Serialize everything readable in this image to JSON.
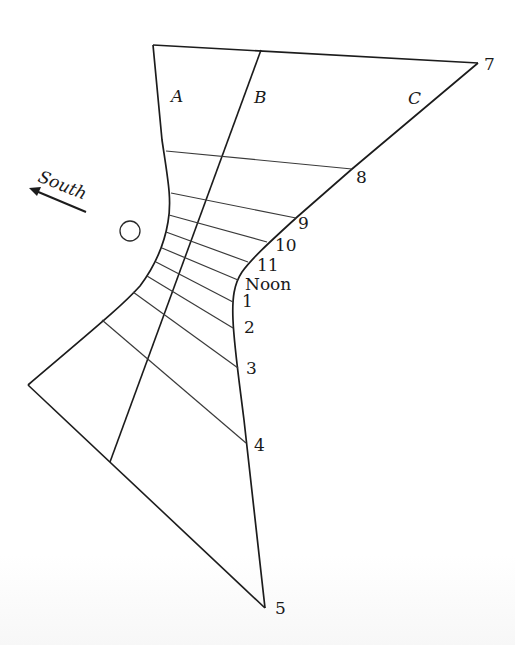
{
  "diagram": {
    "line_labels": {
      "A": "A",
      "B": "B",
      "C": "C"
    },
    "direction": {
      "label": "South",
      "arrow": "arrow-left-up"
    },
    "gnomon_marker": "circle",
    "hour_labels": [
      "7",
      "8",
      "9",
      "10",
      "11",
      "Noon",
      "1",
      "2",
      "3",
      "4",
      "5"
    ],
    "hours": [
      {
        "label": "7",
        "left": [
          153,
          45
        ],
        "right": [
          478,
          63
        ]
      },
      {
        "label": "8",
        "left": [
          166,
          151
        ],
        "right": [
          352,
          169
        ]
      },
      {
        "label": "9",
        "left": [
          171,
          193
        ],
        "right": [
          296,
          218
        ]
      },
      {
        "label": "10",
        "left": [
          169,
          215
        ],
        "right": [
          267,
          242
        ]
      },
      {
        "label": "11",
        "left": [
          166,
          232
        ],
        "right": [
          248,
          262
        ]
      },
      {
        "label": "Noon",
        "left": [
          162,
          248
        ],
        "right": [
          238,
          280
        ]
      },
      {
        "label": "1",
        "left": [
          156,
          262
        ],
        "right": [
          233,
          302
        ]
      },
      {
        "label": "2",
        "left": [
          147,
          276
        ],
        "right": [
          233,
          328
        ]
      },
      {
        "label": "3",
        "left": [
          133,
          292
        ],
        "right": [
          238,
          368
        ]
      },
      {
        "label": "4",
        "left": [
          102,
          320
        ],
        "right": [
          246,
          443
        ]
      },
      {
        "label": "5",
        "left": [
          28,
          385
        ],
        "right": [
          265,
          608
        ]
      }
    ],
    "colors": {
      "line": "#1c1c1c",
      "background": "#ffffff"
    }
  }
}
